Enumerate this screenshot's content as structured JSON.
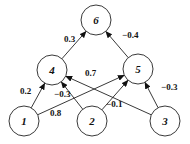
{
  "diagram": {
    "type": "neural-network-graph",
    "nodes": [
      {
        "id": "1",
        "label": "1",
        "x": 24,
        "y": 121,
        "r": 15
      },
      {
        "id": "2",
        "label": "2",
        "x": 92,
        "y": 121,
        "r": 15
      },
      {
        "id": "3",
        "label": "3",
        "x": 165,
        "y": 121,
        "r": 15
      },
      {
        "id": "4",
        "label": "4",
        "x": 52,
        "y": 70,
        "r": 15
      },
      {
        "id": "5",
        "label": "5",
        "x": 138,
        "y": 69,
        "r": 15
      },
      {
        "id": "6",
        "label": "6",
        "x": 96,
        "y": 20,
        "r": 15
      }
    ],
    "edges": [
      {
        "from": "1",
        "to": "4",
        "weight": "0.2",
        "lx": 20,
        "ly": 94
      },
      {
        "from": "1",
        "to": "5",
        "weight": "0.8",
        "lx": 50,
        "ly": 116
      },
      {
        "from": "2",
        "to": "4",
        "weight": "−0.3",
        "lx": 54,
        "ly": 97
      },
      {
        "from": "2",
        "to": "5",
        "weight": "−0.1",
        "lx": 106,
        "ly": 107
      },
      {
        "from": "3",
        "to": "4",
        "weight": "0.7",
        "lx": 85,
        "ly": 76
      },
      {
        "from": "3",
        "to": "5",
        "weight": "−0.3",
        "lx": 161,
        "ly": 90
      },
      {
        "from": "4",
        "to": "6",
        "weight": "0.3",
        "lx": 64,
        "ly": 42
      },
      {
        "from": "5",
        "to": "6",
        "weight": "−0.4",
        "lx": 122,
        "ly": 38
      }
    ]
  }
}
